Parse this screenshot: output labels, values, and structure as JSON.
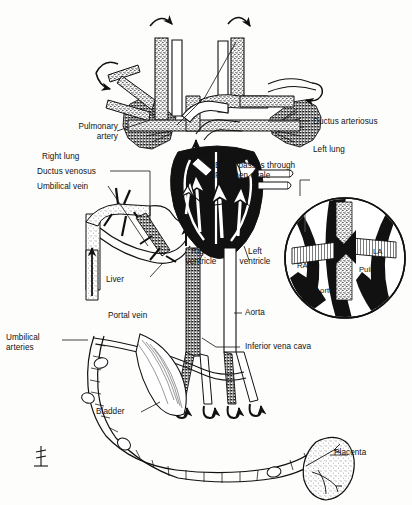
{
  "figure": {
    "type": "anatomical-line-diagram",
    "background_color": "#fdfdfc",
    "ink_color": "#121212"
  },
  "labels": {
    "pulmonary_artery": "Pulmonary\nartery",
    "right_lung": "Right lung",
    "ductus_arteriosus": "Ductus arteriosus",
    "left_lung": "Left lung",
    "ductus_venosus": "Ductus venosus",
    "umbilical_vein": "Umbilical vein",
    "foramen_ovale_note": "Blood passes through\nForamen ovale",
    "right_ventricle": "Right\nventricle",
    "left_ventricle": "Left\nventricle",
    "liver": "Liver",
    "portal_vein": "Portal vein",
    "aorta": "Aorta",
    "inferior_vena_cava": "Inferior vena cava",
    "umbilical_arteries": "Umbilical\narteries",
    "bladder": "Bladder",
    "placenta": "Placenta"
  },
  "inset": {
    "name": "foramen-ovale-detail",
    "shape": "circle",
    "labels": {
      "ra": "RA",
      "la": "LA",
      "aorta": "Aorta",
      "pulm_art": "Pulm.\nart."
    }
  },
  "artist_mark": {
    "present": true,
    "description": "small monogram at lower left"
  },
  "structures": [
    {
      "name": "superior-vena-cava",
      "fill": "stippled"
    },
    {
      "name": "pulmonary-trunk",
      "fill": "stippled"
    },
    {
      "name": "aortic-arch",
      "fill": "white"
    },
    {
      "name": "heart",
      "fill": "black"
    },
    {
      "name": "right-lung",
      "fill": "stippled"
    },
    {
      "name": "left-lung",
      "fill": "stippled"
    },
    {
      "name": "liver",
      "fill": "stippled"
    },
    {
      "name": "bladder",
      "fill": "white-hatched"
    },
    {
      "name": "placenta",
      "fill": "stippled"
    },
    {
      "name": "umbilical-cord",
      "fill": "white-coiled"
    },
    {
      "name": "descending-aorta",
      "fill": "stippled"
    },
    {
      "name": "inferior-vena-cava",
      "fill": "stippled"
    }
  ]
}
